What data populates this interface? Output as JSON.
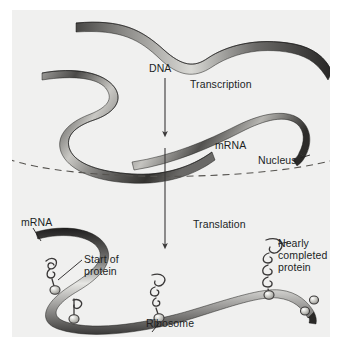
{
  "figure": {
    "background_color": "#f0f0ef",
    "page_color": "#ffffff",
    "ink_color": "#211f1f"
  },
  "labels": {
    "dna": "DNA",
    "transcription": "Transcription",
    "mrna_nucleus": "mRNA",
    "nucleus": "Nucleus",
    "mrna_cytoplasm": "mRNA",
    "translation": "Translation",
    "start_of_protein_line1": "Start of",
    "start_of_protein_line2": "protein",
    "nearly_completed_line1": "Nearly",
    "nearly_completed_line2": "completed",
    "nearly_completed_line3": "protein",
    "ribosome": "Ribosome"
  },
  "structures": {
    "dna_strands": 2,
    "mrna_strands": 2,
    "nucleus_boundary": "dashed-arc",
    "arrows": [
      "transcription-arrow",
      "translation-arrow"
    ],
    "ribosomes": 4,
    "free_subunits": 2
  },
  "colors": {
    "ribbon_dark": "#2f2e2d",
    "ribbon_mid": "#808080",
    "ribbon_light": "#e8e8e6",
    "arrow": "#3a3838",
    "dashed_line": "#55534f",
    "ribosome_fill": "#c9c9c4",
    "ribosome_stroke": "#3a3838"
  }
}
